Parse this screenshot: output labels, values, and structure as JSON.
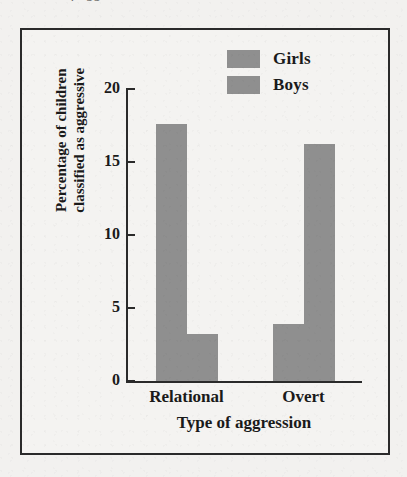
{
  "figure": {
    "caption_sliver_text": "of aggression",
    "frame_color": "#2a2a2a",
    "background_color": "#f4f3f1"
  },
  "legend": {
    "position": "top-right",
    "entries": [
      {
        "label": "Girls",
        "color": "#8f8f8f",
        "swatch_name": "legend-swatch-girls"
      },
      {
        "label": "Boys",
        "color": "#8f8f8f",
        "swatch_name": "legend-swatch-boys"
      }
    ]
  },
  "axes": {
    "y_title_line1": "Percentage of children",
    "y_title_line2": "classified as aggressive",
    "x_title": "Type of aggression",
    "y_ticks": [
      "20",
      "15",
      "10",
      "5",
      "0"
    ]
  },
  "chart_data": {
    "type": "bar",
    "title": "",
    "subtitle": "",
    "xlabel": "Type of aggression",
    "ylabel": "Percentage of children classified as aggressive",
    "categories": [
      "Relational",
      "Overt"
    ],
    "series": [
      {
        "name": "Girls",
        "values": [
          17.6,
          3.9
        ],
        "color": "#8f8f8f"
      },
      {
        "name": "Boys",
        "values": [
          3.2,
          16.2
        ],
        "color": "#8f8f8f"
      }
    ],
    "ylim": [
      0,
      20
    ],
    "ytick_values": [
      0,
      5,
      10,
      15,
      20
    ],
    "grid": false,
    "legend_position": "top-right"
  }
}
